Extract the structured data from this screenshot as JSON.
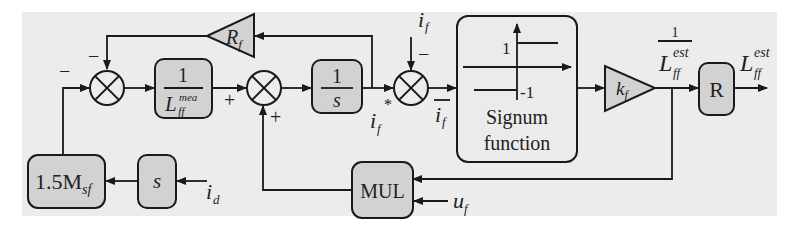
{
  "diagram": {
    "type": "control block diagram",
    "blocks": {
      "rf_gain": {
        "label": "R",
        "sub": "f"
      },
      "inv_lmea": {
        "num": "1",
        "den_main": "L",
        "den_sub": "ff",
        "den_sup": "mea"
      },
      "integrator": {
        "num": "1",
        "den": "s"
      },
      "signum": {
        "title_line1": "Signum",
        "title_line2": "function",
        "pos_level": "1",
        "neg_level": "-1"
      },
      "kf_gain": {
        "label": "k",
        "sub": "f"
      },
      "reciprocal": {
        "label": "R"
      },
      "msf_gain": {
        "label": "1.5M",
        "sub": "sf"
      },
      "derivative": {
        "label": "s"
      },
      "multiplier": {
        "label": "MUL"
      }
    },
    "signals": {
      "if_input": {
        "main": "i",
        "sub": "f",
        "sign": "−"
      },
      "if_star": {
        "main": "i",
        "sub": "f",
        "sup": "*"
      },
      "if_bar": {
        "main": "i",
        "sub": "f"
      },
      "inv_lest": {
        "num": "1",
        "main": "L",
        "sub": "ff",
        "sup": "est"
      },
      "lest_out": {
        "main": "L",
        "sub": "ff",
        "sup": "est"
      },
      "id_input": {
        "main": "i",
        "sub": "d"
      },
      "uf_input": {
        "main": "u",
        "sub": "f"
      }
    },
    "signs": {
      "sum1_top": "−",
      "sum1_left": "−",
      "sum2_left": "+",
      "sum2_bottom": "+",
      "sum3_top": "−"
    }
  }
}
